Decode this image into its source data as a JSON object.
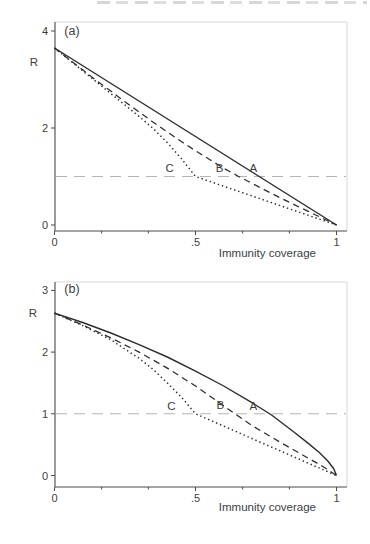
{
  "colors": {
    "text": "#3d3d3d",
    "curve": "#2d2d2d",
    "reference_line": "#b5b5b5",
    "plot_border": "#d8d8d8",
    "background": "#ffffff"
  },
  "chart_data": [
    {
      "type": "line",
      "panel_label": "(a)",
      "ylabel": "R",
      "xlabel": "Immunity coverage",
      "xlim": [
        0,
        1
      ],
      "ylim": [
        0,
        4
      ],
      "grid": false,
      "x_ticks": [
        {
          "v": 0,
          "label": "0"
        },
        {
          "v": 0.5,
          "label": ".5"
        },
        {
          "v": 1,
          "label": "1"
        }
      ],
      "x_minor_ticks": [
        0.167,
        0.333,
        0.667,
        0.833
      ],
      "y_ticks": [
        {
          "v": 0,
          "label": "0"
        },
        {
          "v": 2,
          "label": "2"
        },
        {
          "v": 4,
          "label": "4"
        }
      ],
      "reference_line_y": 1,
      "series": [
        {
          "name": "A",
          "style": "solid",
          "points": [
            [
              0,
              3.65
            ],
            [
              1,
              0
            ]
          ],
          "label_pos": [
            0.705,
            1.17
          ]
        },
        {
          "name": "B",
          "style": "dashed",
          "points": [
            [
              0,
              3.65
            ],
            [
              0.05,
              3.42
            ],
            [
              0.1,
              3.2
            ],
            [
              0.15,
              2.97
            ],
            [
              0.2,
              2.76
            ],
            [
              0.25,
              2.54
            ],
            [
              0.3,
              2.33
            ],
            [
              0.35,
              2.12
            ],
            [
              0.4,
              1.92
            ],
            [
              0.45,
              1.72
            ],
            [
              0.5,
              1.53
            ],
            [
              0.55,
              1.35
            ],
            [
              0.6,
              1.17
            ],
            [
              0.65,
              1.01
            ],
            [
              0.7,
              0.86
            ],
            [
              0.75,
              0.71
            ],
            [
              0.8,
              0.56
            ],
            [
              0.85,
              0.42
            ],
            [
              0.9,
              0.28
            ],
            [
              0.95,
              0.14
            ],
            [
              1,
              0
            ]
          ],
          "label_pos": [
            0.585,
            1.17
          ]
        },
        {
          "name": "C",
          "style": "dotted",
          "points": [
            [
              0,
              3.65
            ],
            [
              0.1,
              3.18
            ],
            [
              0.2,
              2.71
            ],
            [
              0.3,
              2.24
            ],
            [
              0.35,
              1.99
            ],
            [
              0.4,
              1.7
            ],
            [
              0.45,
              1.37
            ],
            [
              0.5,
              1.0
            ],
            [
              1,
              0
            ]
          ],
          "label_pos": [
            0.408,
            1.18
          ]
        }
      ]
    },
    {
      "type": "line",
      "panel_label": "(b)",
      "ylabel": "R",
      "xlabel": "Immunity coverage",
      "xlim": [
        0,
        1
      ],
      "ylim": [
        0,
        3
      ],
      "grid": false,
      "x_ticks": [
        {
          "v": 0,
          "label": "0"
        },
        {
          "v": 0.5,
          "label": ".5"
        },
        {
          "v": 1,
          "label": "1"
        }
      ],
      "x_minor_ticks": [
        0.167,
        0.333,
        0.667,
        0.833
      ],
      "y_ticks": [
        {
          "v": 0,
          "label": "0"
        },
        {
          "v": 1,
          "label": "1"
        },
        {
          "v": 2,
          "label": "2"
        },
        {
          "v": 3,
          "label": "3"
        }
      ],
      "reference_line_y": 1,
      "series": [
        {
          "name": "A",
          "style": "solid",
          "points": [
            [
              0,
              2.63
            ],
            [
              0.1,
              2.48
            ],
            [
              0.2,
              2.31
            ],
            [
              0.3,
              2.12
            ],
            [
              0.4,
              1.92
            ],
            [
              0.5,
              1.69
            ],
            [
              0.6,
              1.45
            ],
            [
              0.7,
              1.18
            ],
            [
              0.77,
              0.98
            ],
            [
              0.85,
              0.7
            ],
            [
              0.9,
              0.52
            ],
            [
              0.94,
              0.37
            ],
            [
              0.97,
              0.23
            ],
            [
              0.99,
              0.11
            ],
            [
              1,
              0
            ]
          ],
          "label_pos": [
            0.705,
            1.13
          ]
        },
        {
          "name": "B",
          "style": "dashed",
          "points": [
            [
              0,
              2.63
            ],
            [
              0.1,
              2.44
            ],
            [
              0.2,
              2.23
            ],
            [
              0.3,
              2.0
            ],
            [
              0.4,
              1.74
            ],
            [
              0.5,
              1.45
            ],
            [
              0.6,
              1.13
            ],
            [
              0.65,
              0.97
            ],
            [
              0.7,
              0.81
            ],
            [
              0.8,
              0.54
            ],
            [
              0.9,
              0.28
            ],
            [
              0.95,
              0.15
            ],
            [
              1,
              0
            ]
          ],
          "label_pos": [
            0.588,
            1.14
          ]
        },
        {
          "name": "C",
          "style": "dotted",
          "points": [
            [
              0,
              2.63
            ],
            [
              0.1,
              2.43
            ],
            [
              0.2,
              2.2
            ],
            [
              0.3,
              1.9
            ],
            [
              0.35,
              1.72
            ],
            [
              0.4,
              1.5
            ],
            [
              0.45,
              1.27
            ],
            [
              0.5,
              1.0
            ],
            [
              0.6,
              0.8
            ],
            [
              0.7,
              0.6
            ],
            [
              0.8,
              0.4
            ],
            [
              0.9,
              0.2
            ],
            [
              1,
              0
            ]
          ],
          "label_pos": [
            0.415,
            1.12
          ]
        }
      ]
    }
  ]
}
